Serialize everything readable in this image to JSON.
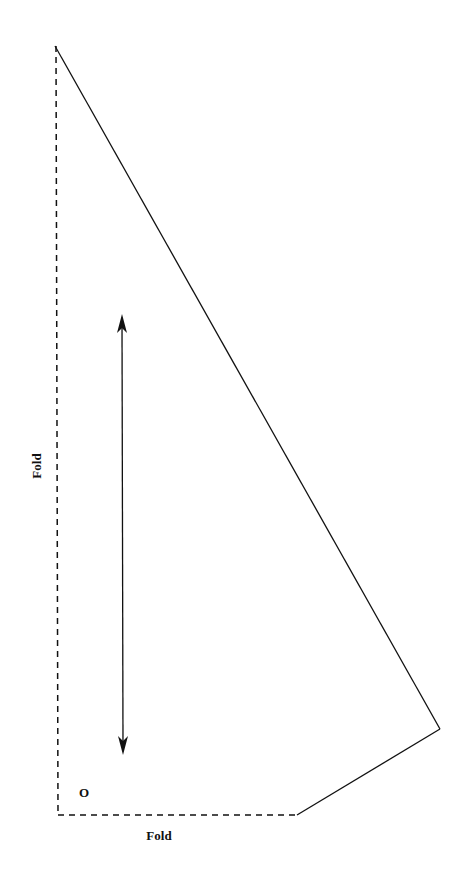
{
  "diagram": {
    "type": "sewing-pattern-piece",
    "labels": {
      "fold_left": "Fold",
      "fold_bottom": "Fold",
      "corner_mark": "O"
    },
    "edges": {
      "left": "fold (dashed)",
      "bottom": "fold (dashed)",
      "diagonal": "cut line (solid)",
      "lower_right": "cut line (solid)"
    },
    "grainline": "double-headed arrow (vertical)",
    "colors": {
      "line": "#111111",
      "background": "#ffffff"
    }
  }
}
